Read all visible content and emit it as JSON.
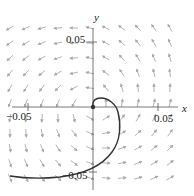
{
  "chart_data": {
    "type": "vector-field-with-trajectory",
    "title": "",
    "xlabel": "x",
    "ylabel": "y",
    "xlim": [
      -0.06,
      0.06
    ],
    "ylim": [
      -0.06,
      0.06
    ],
    "x_ticks": [
      -0.05,
      0.05
    ],
    "y_ticks": [
      0.05,
      -0.05
    ],
    "x_tick_labels": [
      "-0.05",
      "0.05"
    ],
    "y_tick_labels": [
      "0.05",
      "-0.05"
    ],
    "grid": false,
    "legend": null,
    "field": {
      "description": "counterclockwise spiral field centered at origin",
      "color": "#aaaaaa"
    },
    "trajectory": {
      "description": "spiral trajectory from origin outward, ending near lower-left",
      "color": "#333333",
      "points": [
        [
          0,
          0
        ],
        [
          0.002,
          0.007
        ],
        [
          0.012,
          0.005
        ],
        [
          0.02,
          -0.01
        ],
        [
          0.022,
          -0.025
        ],
        [
          0.012,
          -0.045
        ],
        [
          -0.01,
          -0.056
        ],
        [
          -0.05,
          -0.06
        ],
        [
          -0.08,
          -0.058
        ]
      ]
    }
  },
  "axes": {
    "x_label": "x",
    "y_label": "y",
    "x_tick_neg": "−0.05",
    "x_tick_pos": "0.05",
    "y_tick_pos": "0.05",
    "y_tick_neg": "−0.05"
  }
}
